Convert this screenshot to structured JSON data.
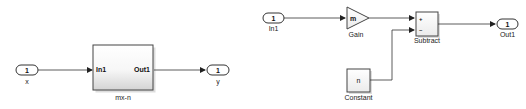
{
  "diagram_left": {
    "inport": {
      "number": "1",
      "name": "x"
    },
    "subsystem": {
      "name": "mx-n",
      "input_port": "In1",
      "output_port": "Out1"
    },
    "outport": {
      "number": "1",
      "name": "y"
    }
  },
  "diagram_right": {
    "inport": {
      "number": "1",
      "name": "In1"
    },
    "gain": {
      "value": "m",
      "name": "Gain"
    },
    "constant": {
      "value": "n",
      "name": "Constant"
    },
    "subtract": {
      "name": "Subtract",
      "sign_plus": "+",
      "sign_minus": "–"
    },
    "outport": {
      "number": "1",
      "name": "Out1"
    }
  },
  "colors": {
    "line": "#333333",
    "block_border": "#444444",
    "block_fill_top": "#ffffff",
    "block_fill_bottom": "#d9d9d9"
  }
}
